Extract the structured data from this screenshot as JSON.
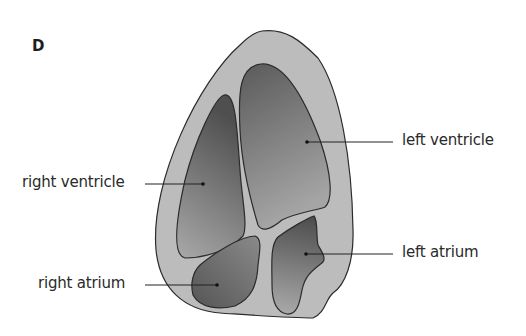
{
  "figure": {
    "panel_letter": "D",
    "labels": {
      "left_ventricle": "left ventricle",
      "right_ventricle": "right ventricle",
      "left_atrium": "left atrium",
      "right_atrium": "right atrium"
    },
    "colors": {
      "wall": "#b9b9b9",
      "chamber_dark": "#5e5e5e",
      "chamber_light": "#a8a8a8",
      "outline": "#2b2b2b"
    }
  }
}
